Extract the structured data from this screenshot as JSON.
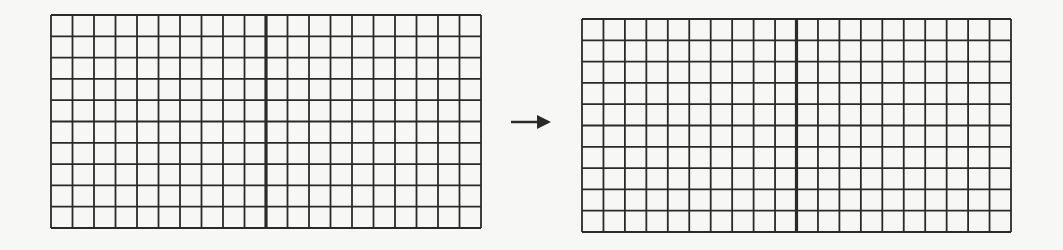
{
  "diagram": {
    "colors": {
      "background": "#f7f7f5",
      "line": "#2a2a2a",
      "cell": "#f7f7f5"
    },
    "grids": [
      {
        "id": "left",
        "columns": 20,
        "rows": 10,
        "thick_divider_after_column": 10,
        "x": 50,
        "y": 14,
        "width": 430,
        "height": 213
      },
      {
        "id": "right",
        "columns": 20,
        "rows": 10,
        "thick_divider_after_column": 10,
        "x": 581,
        "y": 18,
        "width": 429,
        "height": 213
      }
    ],
    "arrow": {
      "direction": "right",
      "glyph": "arrow-right-icon",
      "x1": 511,
      "x2": 551,
      "y": 122
    }
  }
}
